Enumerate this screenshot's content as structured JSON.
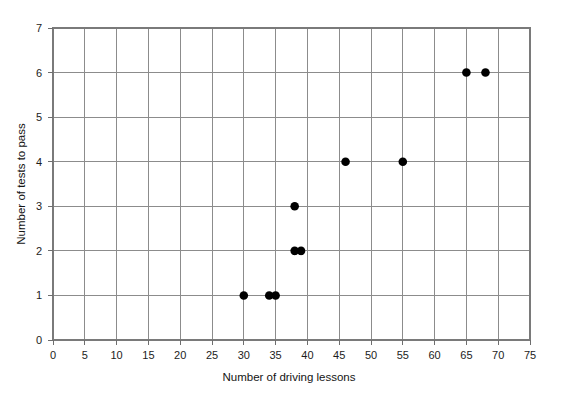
{
  "chart_data": {
    "type": "scatter",
    "title": "",
    "xlabel": "Number of driving lessons",
    "ylabel": "Number of tests to pass",
    "xlim": [
      0,
      75
    ],
    "ylim": [
      0,
      7
    ],
    "xticks": [
      0,
      5,
      10,
      15,
      20,
      25,
      30,
      35,
      40,
      45,
      50,
      55,
      60,
      65,
      70,
      75
    ],
    "yticks": [
      0,
      1,
      2,
      3,
      4,
      5,
      6,
      7
    ],
    "xtick_labels": [
      "0",
      "5",
      "10",
      "15",
      "20",
      "25",
      "30",
      "35",
      "40",
      "45",
      "50",
      "55",
      "60",
      "65",
      "70",
      "75"
    ],
    "ytick_labels": [
      "0",
      "1",
      "2",
      "3",
      "4",
      "5",
      "6",
      "7"
    ],
    "grid": true,
    "legend": null,
    "marker": "filled-circle",
    "marker_color": "#000000",
    "points": [
      {
        "x": 30,
        "y": 1
      },
      {
        "x": 34,
        "y": 1
      },
      {
        "x": 35,
        "y": 1
      },
      {
        "x": 38,
        "y": 2
      },
      {
        "x": 39,
        "y": 2
      },
      {
        "x": 38,
        "y": 3
      },
      {
        "x": 46,
        "y": 4
      },
      {
        "x": 55,
        "y": 4
      },
      {
        "x": 65,
        "y": 6
      },
      {
        "x": 68,
        "y": 6
      }
    ]
  },
  "colors": {
    "background": "#ffffff",
    "grid": "#8c8c8c",
    "frame": "#7a7a7a",
    "marker": "#000000",
    "text": "#1a1a1a"
  }
}
